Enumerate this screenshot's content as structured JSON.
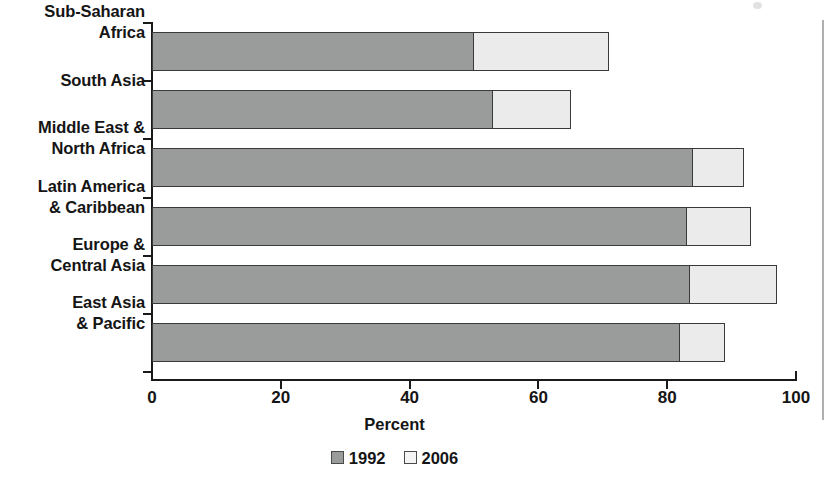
{
  "chart_data": {
    "type": "bar",
    "orientation": "horizontal",
    "stacked": false,
    "overlaid": true,
    "title": "",
    "xlabel": "Percent",
    "ylabel": "",
    "xlim": [
      0,
      100
    ],
    "xticks": [
      0,
      20,
      40,
      60,
      80,
      100
    ],
    "xtick_labels": [
      "0",
      "20",
      "40",
      "60",
      "80",
      "100"
    ],
    "grid": false,
    "legend_position": "bottom",
    "categories": [
      "Sub-Saharan Africa",
      "South Asia",
      "Middle East & North Africa",
      "Latin America & Caribbean",
      "Europe & Central Asia",
      "East Asia & Pacific"
    ],
    "series": [
      {
        "name": "1992",
        "color": "#9a9b9b",
        "values": [
          50,
          53,
          84,
          83,
          83.5,
          82
        ]
      },
      {
        "name": "2006",
        "color": "#ebebeb",
        "values": [
          71,
          65,
          92,
          93,
          97,
          89
        ]
      }
    ]
  },
  "axis": {
    "x_title": "Percent",
    "tick_labels": [
      "0",
      "20",
      "40",
      "60",
      "80",
      "100"
    ]
  },
  "categories": [
    {
      "id": "sub-saharan-africa",
      "line1": "Sub-Saharan",
      "line2": "Africa",
      "v1992": 50,
      "v2006": 71
    },
    {
      "id": "south-asia",
      "line1": "South Asia",
      "line2": "",
      "v1992": 53,
      "v2006": 65
    },
    {
      "id": "middle-east-north-africa",
      "line1": "Middle East &",
      "line2": "North Africa",
      "v1992": 84,
      "v2006": 92
    },
    {
      "id": "latin-america-caribbean",
      "line1": "Latin America",
      "line2": "& Caribbean",
      "v1992": 83,
      "v2006": 93
    },
    {
      "id": "europe-central-asia",
      "line1": "Europe &",
      "line2": "Central Asia",
      "v1992": 83.5,
      "v2006": 97
    },
    {
      "id": "east-asia-pacific",
      "line1": "East Asia",
      "line2": "& Pacific",
      "v1992": 82,
      "v2006": 89
    }
  ],
  "legend": {
    "items": [
      {
        "label": "1992",
        "color": "#9a9b9b"
      },
      {
        "label": "2006",
        "color": "#f4f4f4"
      }
    ]
  }
}
